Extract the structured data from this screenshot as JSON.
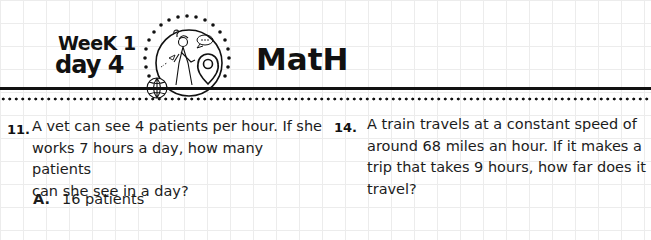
{
  "header": {
    "week": "WeeK 1",
    "day": "day 4",
    "subject": "MatH",
    "emblem_icon": "explorer-globe-map-pin-illustration"
  },
  "questions": [
    {
      "number": "11.",
      "lines": [
        "A vet can see 4 patients per hour. If she",
        "works 7 hours a day, how many patients",
        "can she see in a day?"
      ],
      "choices": [
        {
          "letter": "A.",
          "text": "16 patients"
        }
      ]
    },
    {
      "number": "14.",
      "lines": [
        "A train travels at a constant speed of",
        "around 68 miles an hour. If it makes a",
        "trip that takes 9 hours, how far does it",
        "travel?"
      ],
      "choices": []
    }
  ]
}
